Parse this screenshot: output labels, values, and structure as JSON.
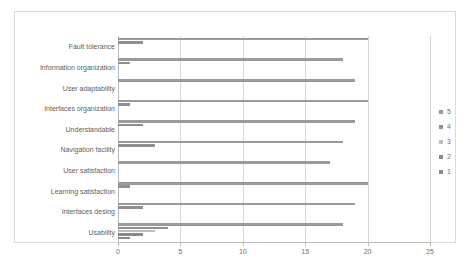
{
  "chart_data": {
    "type": "bar",
    "orientation": "horizontal",
    "title": "",
    "xlabel": "",
    "ylabel": "",
    "xlim": [
      0,
      25
    ],
    "xticks": [
      0,
      5,
      10,
      15,
      20,
      25
    ],
    "grid": true,
    "legend_position": "right",
    "legend_order": [
      "5",
      "4",
      "3",
      "2",
      "1"
    ],
    "categories": [
      "Fault tolerance",
      "Information organization",
      "User adaptability",
      "Interfaces organization",
      "Understandable",
      "Navigation facility",
      "User satisfaction",
      "Learning satisfaction",
      "Interfaces desing",
      "Usability"
    ],
    "series": [
      {
        "name": "5",
        "color": "#9a9a9a",
        "values": [
          20,
          18,
          19,
          20,
          19,
          18,
          17,
          20,
          19,
          18
        ]
      },
      {
        "name": "4",
        "color": "#8f8f8f",
        "values": [
          2,
          1,
          0,
          1,
          2,
          3,
          0,
          1,
          2,
          4
        ]
      },
      {
        "name": "3",
        "color": "#bdbdbd",
        "values": [
          0,
          0,
          0,
          0,
          0,
          0,
          0,
          0,
          0,
          3
        ]
      },
      {
        "name": "2",
        "color": "#8a8a8a",
        "values": [
          0,
          0,
          0,
          0,
          0,
          0,
          0,
          0,
          0,
          2
        ]
      },
      {
        "name": "1",
        "color": "#8a8a8a",
        "values": [
          0,
          0,
          0,
          0,
          0,
          0,
          0,
          0,
          0,
          1
        ]
      }
    ]
  },
  "legend": {
    "items": [
      {
        "label": "5",
        "color": "#9a9a9a"
      },
      {
        "label": "4",
        "color": "#8f8f8f"
      },
      {
        "label": "3",
        "color": "#bdbdbd"
      },
      {
        "label": "2",
        "color": "#8a8a8a"
      },
      {
        "label": "1",
        "color": "#8a8a8a"
      }
    ]
  },
  "axis": {
    "x_tick_labels": [
      "0",
      "5",
      "10",
      "15",
      "20",
      "25"
    ],
    "y_tick_labels": [
      "Fault tolerance",
      "Information organization",
      "User adaptability",
      "Interfaces organization",
      "Understandable",
      "Navigation facility",
      "User satisfaction",
      "Learning satisfaction",
      "Interfaces desing",
      "Usability"
    ]
  }
}
